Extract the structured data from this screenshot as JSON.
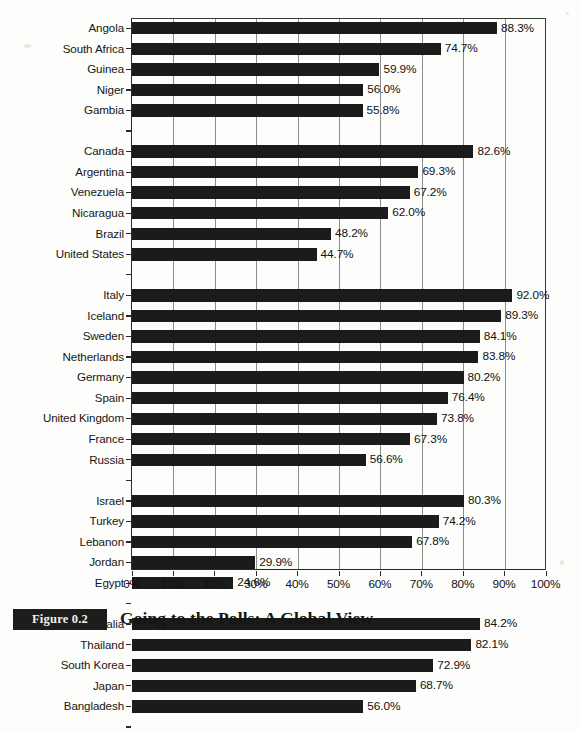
{
  "figure": {
    "number_label": "Figure 0.2",
    "title": "Going to the Polls: A Global View"
  },
  "chart_data": {
    "type": "bar",
    "orientation": "horizontal",
    "title": "Going to the Polls: A Global View",
    "xlabel": "",
    "ylabel": "",
    "xlim": [
      0,
      100
    ],
    "xticks": [
      "0%",
      "10%",
      "20%",
      "30%",
      "40%",
      "50%",
      "60%",
      "70%",
      "80%",
      "90%",
      "100%"
    ],
    "xtick_values": [
      0,
      10,
      20,
      30,
      40,
      50,
      60,
      70,
      80,
      90,
      100
    ],
    "grid": "vertical",
    "legend": "none",
    "value_label_suffix": "%",
    "bar_color": "#1b1b1b",
    "categories": [
      "Angola",
      "South Africa",
      "Guinea",
      "Niger",
      "Gambia",
      "Canada",
      "Argentina",
      "Venezuela",
      "Nicaragua",
      "Brazil",
      "United States",
      "Italy",
      "Iceland",
      "Sweden",
      "Netherlands",
      "Germany",
      "Spain",
      "United Kingdom",
      "France",
      "Russia",
      "Israel",
      "Turkey",
      "Lebanon",
      "Jordan",
      "Egypt",
      "Australia",
      "Thailand",
      "South Korea",
      "Japan",
      "Bangladesh"
    ],
    "values": [
      88.3,
      74.7,
      59.9,
      56.0,
      55.8,
      82.6,
      69.3,
      67.2,
      62.0,
      48.2,
      44.7,
      92.0,
      89.3,
      84.1,
      83.8,
      80.2,
      76.4,
      73.8,
      67.3,
      56.6,
      80.3,
      74.2,
      67.8,
      29.9,
      24.6,
      84.2,
      82.1,
      72.9,
      68.7,
      56.0
    ],
    "value_labels": [
      "88.3%",
      "74.7%",
      "59.9%",
      "56.0%",
      "55.8%",
      "82.6%",
      "69.3%",
      "67.2%",
      "62.0%",
      "48.2%",
      "44.7%",
      "92.0%",
      "89.3%",
      "84.1%",
      "83.8%",
      "80.2%",
      "76.4%",
      "73.8%",
      "67.3%",
      "56.6%",
      "80.3%",
      "74.2%",
      "67.8%",
      "29.9%",
      "24.6%",
      "84.2%",
      "82.1%",
      "72.9%",
      "68.7%",
      "56.0%"
    ],
    "groups": [
      {
        "start": 0,
        "count": 5
      },
      {
        "start": 5,
        "count": 6
      },
      {
        "start": 11,
        "count": 9
      },
      {
        "start": 20,
        "count": 5
      },
      {
        "start": 25,
        "count": 5
      }
    ]
  }
}
